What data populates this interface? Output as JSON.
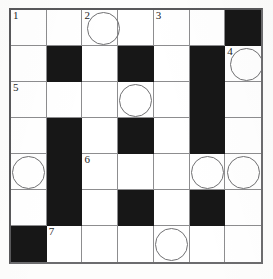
{
  "puzzle": {
    "title": "Crossword Grid",
    "columns": 7,
    "rows": 7,
    "colors": {
      "block": "#171717",
      "cell": "#ffffff",
      "grid_line": "#8d8d8f",
      "border": "#58585a",
      "circle_stroke": "#707072",
      "number_text": "#1d1d1d"
    },
    "cells": [
      [
        {
          "type": "open",
          "number": "1",
          "circle": false,
          "letter": ""
        },
        {
          "type": "open",
          "number": "",
          "circle": false,
          "letter": ""
        },
        {
          "type": "open",
          "number": "2",
          "circle": true,
          "letter": ""
        },
        {
          "type": "open",
          "number": "",
          "circle": false,
          "letter": ""
        },
        {
          "type": "open",
          "number": "3",
          "circle": false,
          "letter": ""
        },
        {
          "type": "open",
          "number": "",
          "circle": false,
          "letter": ""
        },
        {
          "type": "block",
          "number": "",
          "circle": false,
          "letter": ""
        }
      ],
      [
        {
          "type": "open",
          "number": "",
          "circle": false,
          "letter": ""
        },
        {
          "type": "block",
          "number": "",
          "circle": false,
          "letter": ""
        },
        {
          "type": "open",
          "number": "",
          "circle": false,
          "letter": ""
        },
        {
          "type": "block",
          "number": "",
          "circle": false,
          "letter": ""
        },
        {
          "type": "open",
          "number": "",
          "circle": false,
          "letter": ""
        },
        {
          "type": "block",
          "number": "",
          "circle": false,
          "letter": ""
        },
        {
          "type": "open",
          "number": "4",
          "circle": true,
          "letter": ""
        }
      ],
      [
        {
          "type": "open",
          "number": "5",
          "circle": false,
          "letter": ""
        },
        {
          "type": "open",
          "number": "",
          "circle": false,
          "letter": ""
        },
        {
          "type": "open",
          "number": "",
          "circle": false,
          "letter": ""
        },
        {
          "type": "open",
          "number": "",
          "circle": true,
          "letter": ""
        },
        {
          "type": "open",
          "number": "",
          "circle": false,
          "letter": ""
        },
        {
          "type": "block",
          "number": "",
          "circle": false,
          "letter": ""
        },
        {
          "type": "open",
          "number": "",
          "circle": false,
          "letter": ""
        }
      ],
      [
        {
          "type": "open",
          "number": "",
          "circle": false,
          "letter": ""
        },
        {
          "type": "block",
          "number": "",
          "circle": false,
          "letter": ""
        },
        {
          "type": "open",
          "number": "",
          "circle": false,
          "letter": ""
        },
        {
          "type": "block",
          "number": "",
          "circle": false,
          "letter": ""
        },
        {
          "type": "open",
          "number": "",
          "circle": false,
          "letter": ""
        },
        {
          "type": "block",
          "number": "",
          "circle": false,
          "letter": ""
        },
        {
          "type": "open",
          "number": "",
          "circle": false,
          "letter": ""
        }
      ],
      [
        {
          "type": "open",
          "number": "",
          "circle": true,
          "letter": ""
        },
        {
          "type": "block",
          "number": "",
          "circle": false,
          "letter": ""
        },
        {
          "type": "open",
          "number": "6",
          "circle": false,
          "letter": ""
        },
        {
          "type": "open",
          "number": "",
          "circle": false,
          "letter": ""
        },
        {
          "type": "open",
          "number": "",
          "circle": false,
          "letter": ""
        },
        {
          "type": "open",
          "number": "",
          "circle": true,
          "letter": ""
        },
        {
          "type": "open",
          "number": "",
          "circle": true,
          "letter": ""
        }
      ],
      [
        {
          "type": "open",
          "number": "",
          "circle": false,
          "letter": ""
        },
        {
          "type": "block",
          "number": "",
          "circle": false,
          "letter": ""
        },
        {
          "type": "open",
          "number": "",
          "circle": false,
          "letter": ""
        },
        {
          "type": "block",
          "number": "",
          "circle": false,
          "letter": ""
        },
        {
          "type": "open",
          "number": "",
          "circle": false,
          "letter": ""
        },
        {
          "type": "block",
          "number": "",
          "circle": false,
          "letter": ""
        },
        {
          "type": "open",
          "number": "",
          "circle": false,
          "letter": ""
        }
      ],
      [
        {
          "type": "block",
          "number": "",
          "circle": false,
          "letter": ""
        },
        {
          "type": "open",
          "number": "7",
          "circle": false,
          "letter": ""
        },
        {
          "type": "open",
          "number": "",
          "circle": false,
          "letter": ""
        },
        {
          "type": "open",
          "number": "",
          "circle": false,
          "letter": ""
        },
        {
          "type": "open",
          "number": "",
          "circle": true,
          "letter": ""
        },
        {
          "type": "open",
          "number": "",
          "circle": false,
          "letter": ""
        },
        {
          "type": "open",
          "number": "",
          "circle": false,
          "letter": ""
        }
      ]
    ]
  }
}
